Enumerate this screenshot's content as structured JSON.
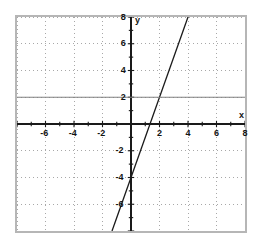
{
  "chart_data": {
    "type": "line",
    "title": "",
    "xlabel": "x",
    "ylabel": "y",
    "xlim": [
      -8,
      8
    ],
    "ylim": [
      -8,
      8
    ],
    "grid": true,
    "grid_style": "dotted",
    "grid_step": 2,
    "tick_step": 1,
    "legend": "none",
    "x_tick_labels": [
      "-6",
      "-4",
      "-2",
      "2",
      "4",
      "6",
      "8"
    ],
    "x_tick_values": [
      -6,
      -4,
      -2,
      2,
      4,
      6,
      8
    ],
    "y_tick_labels": [
      "8",
      "6",
      "4",
      "2",
      "-2",
      "-4",
      "-6"
    ],
    "y_tick_values": [
      8,
      6,
      4,
      2,
      -2,
      -4,
      -6
    ],
    "series": [
      {
        "name": "steep-line",
        "type": "line",
        "slope": 3,
        "intercept": -4,
        "x": [
          -1.35,
          4.0
        ],
        "y": [
          -8.0,
          8.0
        ],
        "color": "#1a1a1a",
        "width": 1.3
      },
      {
        "name": "horizontal-line",
        "type": "line",
        "slope": 0,
        "intercept": 2,
        "x": [
          -8,
          8
        ],
        "y": [
          2,
          2
        ],
        "color": "#808080",
        "width": 1.2
      }
    ]
  },
  "figure": {
    "axis_color": "#1a1a1a",
    "grid_color": "#a8a8a8",
    "frame_color": "#b6b6b6",
    "background": "#ffffff",
    "x_axis_label": "x",
    "y_axis_label": "y"
  }
}
